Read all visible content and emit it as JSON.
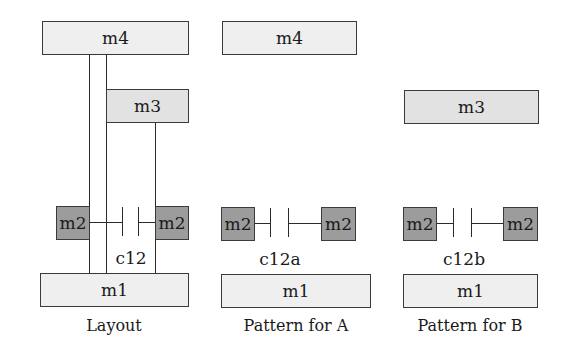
{
  "panels": {
    "layout": {
      "caption": "Layout",
      "m4": "m4",
      "m3": "m3",
      "m2_left": "m2",
      "m2_right": "m2",
      "capacitor": "c12",
      "m1": "m1"
    },
    "pattern_a": {
      "caption": "Pattern for A",
      "m4": "m4",
      "m2_left": "m2",
      "m2_right": "m2",
      "capacitor": "c12a",
      "m1": "m1"
    },
    "pattern_b": {
      "caption": "Pattern for B",
      "m3": "m3",
      "m2_left": "m2",
      "m2_right": "m2",
      "capacitor": "c12b",
      "m1": "m1"
    }
  },
  "colors": {
    "m4_fill": "#efefef",
    "m3_fill": "#e2e2e2",
    "m2_fill": "#9c9c9c",
    "m1_fill": "#efefef",
    "stroke": "#3a3a3a"
  }
}
